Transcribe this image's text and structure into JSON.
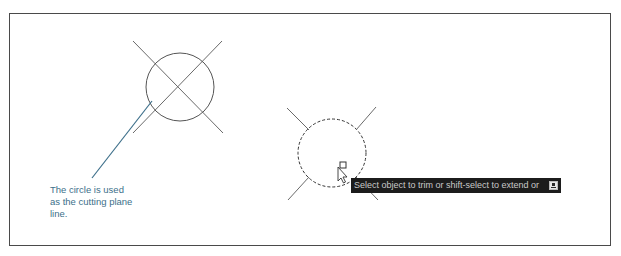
{
  "figure": {
    "frame": {
      "stroke": "#4a4a4a"
    },
    "left_drawing": {
      "description": "Circle with two crossing lines (cutting plane)",
      "circle": {
        "cx": 180,
        "cy": 87,
        "r": 34,
        "style": "solid"
      },
      "lines": [
        {
          "x1": 133,
          "y1": 41,
          "x2": 223,
          "y2": 133
        },
        {
          "x1": 222,
          "y1": 41,
          "x2": 133,
          "y2": 133
        }
      ]
    },
    "leader_line": {
      "x1": 152,
      "y1": 101,
      "x2": 92,
      "y2": 178,
      "color": "#3d6f8a"
    },
    "caption": {
      "lines": [
        "The circle is used",
        "as the cutting plane",
        "line."
      ],
      "color": "#3d6f8a"
    },
    "right_drawing": {
      "description": "Dashed circle (selected) with trimmed lines outside",
      "circle": {
        "cx": 332,
        "cy": 153,
        "r": 34,
        "style": "dashed"
      },
      "lines": [
        {
          "x1": 287,
          "y1": 108,
          "x2": 309,
          "y2": 130
        },
        {
          "x1": 376,
          "y1": 107,
          "x2": 356,
          "y2": 130
        },
        {
          "x1": 309,
          "y1": 177,
          "x2": 288,
          "y2": 200
        },
        {
          "x1": 356,
          "y1": 177,
          "x2": 378,
          "y2": 200
        }
      ]
    },
    "cursor": {
      "icon": "arrow-cursor-icon",
      "pickbox": "pickbox-icon"
    },
    "tooltip": {
      "text": "Select object to trim or shift-select to extend or",
      "icon": "dynamic-input-icon",
      "background": "#1c1c1c",
      "color": "#c9c9c9"
    }
  }
}
